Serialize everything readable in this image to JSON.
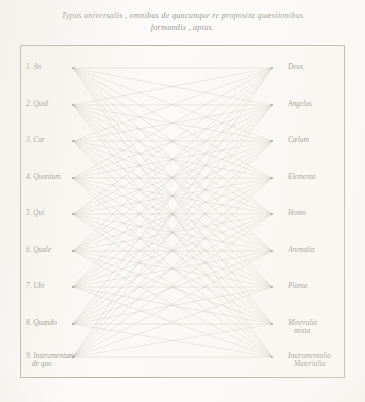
{
  "plate": {
    "title_line_1": "Typus universalis , omnibus de quacunque re proposita quæstionibus",
    "title_line_2": "formandis , aptus.",
    "ink_color": "#6f6c64",
    "frame_color": "#a9a49a",
    "paper_color": "#f4f2ed"
  },
  "chart_data": {
    "type": "diagram",
    "graph": "complete-bipartite",
    "title": "Typus universalis , omnibus de quacunque re proposita quæstionibus formandis , aptus.",
    "left_count": 9,
    "right_count": 9,
    "edge_count": 81,
    "left_nodes": [
      {
        "index": "1.",
        "label": "An",
        "sub": "",
        "y": 23
      },
      {
        "index": "2.",
        "label": "Quid",
        "sub": "",
        "y": 60
      },
      {
        "index": "3.",
        "label": "Cur",
        "sub": "",
        "y": 96
      },
      {
        "index": "4.",
        "label": "Quantum",
        "sub": "",
        "y": 133
      },
      {
        "index": "5.",
        "label": "Qui",
        "sub": "",
        "y": 169
      },
      {
        "index": "6.",
        "label": "Quale",
        "sub": "",
        "y": 206
      },
      {
        "index": "7.",
        "label": "Ubi",
        "sub": "",
        "y": 242
      },
      {
        "index": "8.",
        "label": "Quando",
        "sub": "",
        "y": 279
      },
      {
        "index": "9.",
        "label": "Instrumentum",
        "sub": "de quo",
        "y": 312
      }
    ],
    "right_nodes": [
      {
        "label": "Deus",
        "sub": "",
        "y": 23
      },
      {
        "label": "Angelus",
        "sub": "",
        "y": 60
      },
      {
        "label": "Cælum",
        "sub": "",
        "y": 96
      },
      {
        "label": "Elementa",
        "sub": "",
        "y": 133
      },
      {
        "label": "Homo",
        "sub": "",
        "y": 169
      },
      {
        "label": "Animalia",
        "sub": "",
        "y": 206
      },
      {
        "label": "Planta",
        "sub": "",
        "y": 242
      },
      {
        "label": "Mineralia",
        "sub": "mixta",
        "y": 279
      },
      {
        "label": "Instrumentalia",
        "sub": "Materialia",
        "y": 312
      }
    ]
  }
}
